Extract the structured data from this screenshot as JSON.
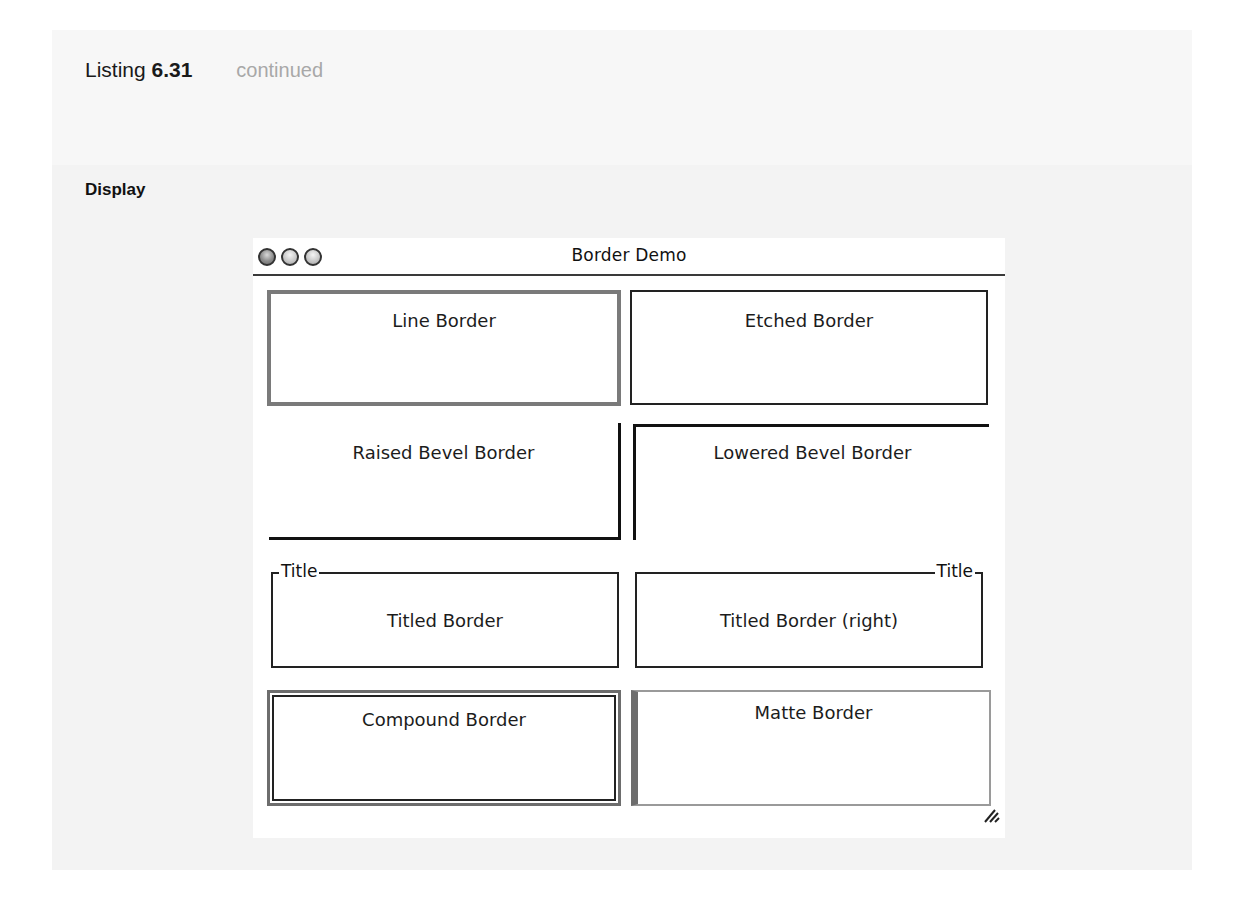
{
  "listing": {
    "prefix": "Listing",
    "number": "6.31",
    "status": "continued"
  },
  "section": {
    "label": "Display"
  },
  "window": {
    "title": "Border Demo",
    "buttons": [
      "close",
      "minimize",
      "zoom"
    ],
    "panels": [
      {
        "id": "line",
        "label": "Line Border"
      },
      {
        "id": "etched",
        "label": "Etched Border"
      },
      {
        "id": "raised",
        "label": "Raised Bevel Border"
      },
      {
        "id": "lowered",
        "label": "Lowered Bevel Border"
      },
      {
        "id": "titled",
        "label": "Titled Border",
        "title": "Title"
      },
      {
        "id": "titled-right",
        "label": "Titled Border (right)",
        "title": "Title"
      },
      {
        "id": "compound",
        "label": "Compound Border"
      },
      {
        "id": "matte",
        "label": "Matte Border"
      }
    ]
  },
  "colors": {
    "matte_gray": "#6d6d6d",
    "line_gray": "#7a7a7a",
    "text": "#1c1c1c"
  }
}
